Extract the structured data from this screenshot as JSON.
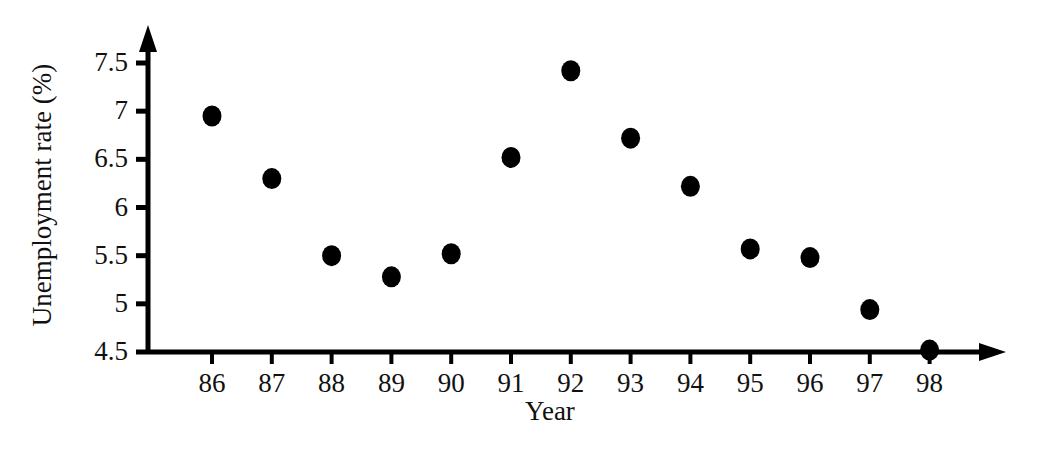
{
  "chart_data": {
    "type": "scatter",
    "title": "",
    "xlabel": "Year",
    "ylabel": "Unemployment rate (%)",
    "categories": [
      "86",
      "87",
      "88",
      "89",
      "90",
      "91",
      "92",
      "93",
      "94",
      "95",
      "96",
      "97",
      "98"
    ],
    "x": [
      86,
      87,
      88,
      89,
      90,
      91,
      92,
      93,
      94,
      95,
      96,
      97,
      98
    ],
    "values": [
      6.95,
      6.3,
      5.5,
      5.28,
      5.52,
      6.52,
      7.42,
      6.72,
      6.22,
      5.57,
      5.48,
      4.94,
      4.52
    ],
    "xlim": [
      85.4,
      98.9
    ],
    "ylim": [
      4.5,
      7.65
    ],
    "x_tick_labels": [
      "86",
      "87",
      "88",
      "89",
      "90",
      "91",
      "92",
      "93",
      "94",
      "95",
      "96",
      "97",
      "98"
    ],
    "y_tick_labels": [
      "7.5",
      "7",
      "6.5",
      "6",
      "5.5",
      "5",
      "4.5"
    ],
    "y_ticks": [
      7.5,
      7,
      6.5,
      6,
      5.5,
      5,
      4.5
    ],
    "grid": false,
    "legend": null,
    "marker": "filled-circle",
    "marker_color": "#000000",
    "axis_color": "#000000",
    "background_color": "#ffffff",
    "axis_arrows": true
  }
}
